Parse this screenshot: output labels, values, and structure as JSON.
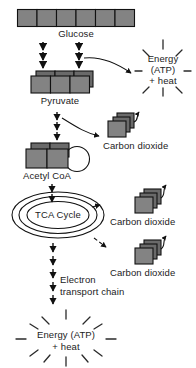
{
  "diagram": {
    "title_cropped": "",
    "type": "cellular-respiration-flow",
    "labels": {
      "glucose": "Glucose",
      "pyruvate": "Pyruvate",
      "acetyl_coa": "Acetyl CoA",
      "tca_cycle": "TCA Cycle",
      "carbon_dioxide_1": "Carbon dioxide",
      "carbon_dioxide_2": "Carbon dioxide",
      "carbon_dioxide_3": "Carbon dioxide",
      "electron_transport_line1": "Electron",
      "electron_transport_line2": "transport chain",
      "energy_top_line1": "Energy",
      "energy_top_line2": "(ATP)",
      "energy_top_line3": "+ heat",
      "energy_bottom_line1": "Energy (ATP)",
      "energy_bottom_line2": "+ heat"
    },
    "colors": {
      "molecule_fill": "#838383",
      "molecule_top": "#6f6f6f",
      "outline": "#111111",
      "text": "#1b1b1b",
      "background": "#ffffff"
    },
    "counts": {
      "glucose_units": 6,
      "pyruvate_units": 3,
      "acetyl_coa_units": 2,
      "co2_stack_units": 3,
      "tca_rings": 3
    }
  }
}
